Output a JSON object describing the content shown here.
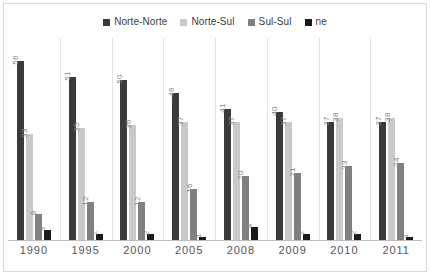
{
  "chart_data": {
    "type": "bar",
    "title": "",
    "subtitle": "",
    "xlabel": "",
    "ylabel": "",
    "ylim": [
      0,
      60
    ],
    "grid": false,
    "legend_position": "top-center",
    "categories": [
      "1990",
      "1995",
      "2000",
      "2005",
      "2008",
      "2009",
      "2010",
      "2011"
    ],
    "series": [
      {
        "name": "Norte-Norte",
        "color": "#3a3a3a",
        "values": [
          56,
          51,
          50,
          46,
          41,
          40,
          37,
          37
        ]
      },
      {
        "name": "Norte-Sul",
        "color": "#c9c9c9",
        "values": [
          33,
          35,
          36,
          37,
          37,
          37,
          38,
          38
        ]
      },
      {
        "name": "Sul-Sul",
        "color": "#808080",
        "values": [
          8,
          12,
          12,
          16,
          20,
          21,
          23,
          24
        ]
      },
      {
        "name": "ne",
        "color": "#1a1a1a",
        "values": [
          3,
          2,
          2,
          1,
          4,
          2,
          2,
          1
        ]
      }
    ]
  },
  "legend": {
    "items": [
      {
        "label": "Norte-Norte",
        "color": "#3a3a3a"
      },
      {
        "label": "Norte-Sul",
        "color": "#c9c9c9"
      },
      {
        "label": "Sul-Sul",
        "color": "#808080"
      },
      {
        "label": "ne",
        "color": "#1a1a1a"
      }
    ]
  },
  "style": {
    "background": "#ffffff",
    "border_color": "#d8d8d8",
    "axis_color": "#bdbdbd",
    "label_color": "#868686",
    "tick_color": "#555555",
    "separator_color": "#e4e4e4"
  }
}
